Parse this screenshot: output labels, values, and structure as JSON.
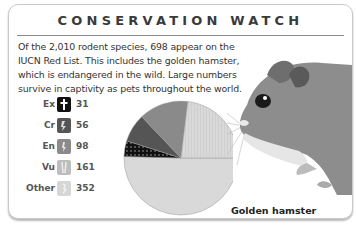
{
  "card": {
    "title": "CONSERVATION WATCH",
    "intro": "Of the 2,010 rodent species, 698 appear on the IUCN Red List. This includes the golden hamster, which is endangered in the wild. Large numbers survive in captivity as pets throughout the world.",
    "caption": "Golden hamster"
  },
  "legend": [
    {
      "label": "Ex",
      "value": "31",
      "icon": "dagger-icon",
      "color": "#111111"
    },
    {
      "label": "Cr",
      "value": "56",
      "icon": "critically-endangered-icon",
      "color": "#555555"
    },
    {
      "label": "En",
      "value": "98",
      "icon": "endangered-icon",
      "color": "#8a8a8a"
    },
    {
      "label": "Vu",
      "value": "161",
      "icon": "vulnerable-icon",
      "color": "#b8b8b8"
    },
    {
      "label": "Other",
      "value": "352",
      "icon": "other-icon",
      "color": "#d6d6d6"
    }
  ],
  "chart_data": {
    "type": "pie",
    "title": "CONSERVATION WATCH",
    "categories": [
      "Ex",
      "Cr",
      "En",
      "Vu",
      "Other"
    ],
    "values": [
      31,
      56,
      98,
      161,
      352
    ],
    "total": 698,
    "colors": [
      "#111111",
      "#555555",
      "#8a8a8a",
      "#bdbdbd",
      "#d9d9d9"
    ],
    "legend_position": "left",
    "annotations": [
      "Golden hamster"
    ]
  }
}
